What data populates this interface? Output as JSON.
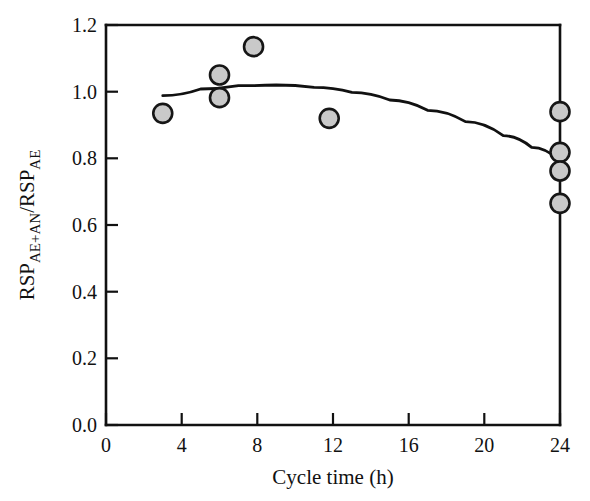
{
  "chart_data": {
    "type": "scatter",
    "title": "",
    "xlabel": "Cycle time (h)",
    "ylabel": "RSP_AE+AN / RSP_AE",
    "ylabel_parts": {
      "base1": "RSP",
      "sub1": "AE+AN",
      "slash": "/",
      "base2": "RSP",
      "sub2": "AE"
    },
    "xlim": [
      0,
      24
    ],
    "ylim": [
      0.0,
      1.2
    ],
    "xticks": [
      0,
      4,
      8,
      12,
      16,
      20,
      24
    ],
    "xtick_labels": [
      "0",
      "4",
      "8",
      "12",
      "16",
      "20",
      "24"
    ],
    "yticks": [
      0.0,
      0.2,
      0.4,
      0.6,
      0.8,
      1.0,
      1.2
    ],
    "ytick_labels": [
      "0.0",
      "0.2",
      "0.4",
      "0.6",
      "0.8",
      "1.0",
      "1.2"
    ],
    "grid": false,
    "legend": false,
    "legend_position": "none",
    "series": [
      {
        "name": "RSP ratio",
        "marker": "filled-circle",
        "marker_fill": "#c9c9c9",
        "marker_edge": "#161616",
        "points": [
          {
            "x": 3.0,
            "y": 0.935
          },
          {
            "x": 6.0,
            "y": 1.05
          },
          {
            "x": 6.0,
            "y": 0.982
          },
          {
            "x": 7.8,
            "y": 1.135
          },
          {
            "x": 11.8,
            "y": 0.92
          },
          {
            "x": 24.0,
            "y": 0.94
          },
          {
            "x": 24.0,
            "y": 0.818
          },
          {
            "x": 24.0,
            "y": 0.762
          },
          {
            "x": 24.0,
            "y": 0.665
          }
        ]
      }
    ],
    "fit_curve": {
      "name": "quadratic fit",
      "color": "#111111",
      "x_start": 3.0,
      "x_end": 24.0,
      "points": [
        {
          "x": 3.0,
          "y": 0.988
        },
        {
          "x": 5.0,
          "y": 1.008
        },
        {
          "x": 7.0,
          "y": 1.018
        },
        {
          "x": 9.0,
          "y": 1.02
        },
        {
          "x": 11.0,
          "y": 1.013
        },
        {
          "x": 13.0,
          "y": 0.998
        },
        {
          "x": 15.0,
          "y": 0.975
        },
        {
          "x": 17.0,
          "y": 0.944
        },
        {
          "x": 19.0,
          "y": 0.91
        },
        {
          "x": 21.0,
          "y": 0.868
        },
        {
          "x": 22.5,
          "y": 0.833
        },
        {
          "x": 24.0,
          "y": 0.793
        }
      ]
    }
  }
}
